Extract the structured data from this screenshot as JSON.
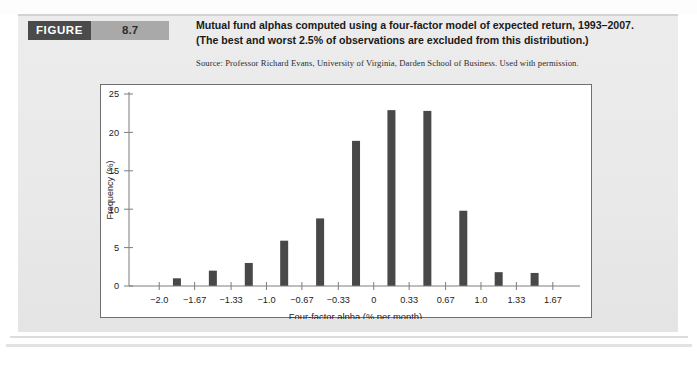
{
  "figure": {
    "tag_word": "FIGURE",
    "number": "8.7",
    "title_line1": "Mutual fund alphas computed using a four-factor model of expected return, 1993–2007.",
    "title_line2": "(The best and worst 2.5% of observations are excluded from this distribution.)",
    "source": "Source: Professor Richard Evans, University of Virginia, Darden School of Business. Used with permission."
  },
  "colors": {
    "bar": "#484848",
    "axis": "#7d7d7d",
    "tag_dark": "#4b4b4b",
    "tag_light": "#a9a9a9",
    "page_bg": "#eaeaea",
    "plot_bg": "#ffffff"
  },
  "chart_data": {
    "type": "bar",
    "title": "Mutual fund alphas computed using a four-factor model of expected return, 1993–2007.",
    "xlabel": "Four-factor alpha (% per month)",
    "ylabel": "Frequency (%)",
    "xlim": [
      -2.17,
      1.83
    ],
    "ylim": [
      0,
      25
    ],
    "grid": false,
    "legend": null,
    "x_tick_labels": [
      "−2.0",
      "−1.67",
      "−1.33",
      "−1.0",
      "−0.67",
      "−0.33",
      "0",
      "0.33",
      "0.67",
      "1.0",
      "1.33",
      "1.67"
    ],
    "x_tick_values": [
      -2.0,
      -1.67,
      -1.33,
      -1.0,
      -0.67,
      -0.33,
      0,
      0.33,
      0.67,
      1.0,
      1.33,
      1.67
    ],
    "y_tick_labels": [
      "0",
      "5",
      "10",
      "15",
      "20",
      "25"
    ],
    "y_tick_values": [
      0,
      5,
      10,
      15,
      20,
      25
    ],
    "bin_centers": [
      -1.835,
      -1.5,
      -1.165,
      -0.835,
      -0.5,
      -0.165,
      0.165,
      0.5,
      0.835,
      1.165,
      1.5
    ],
    "categories": [
      "−1.835",
      "−1.5",
      "−1.165",
      "−0.835",
      "−0.5",
      "−0.165",
      "0.165",
      "0.5",
      "0.835",
      "1.165",
      "1.5"
    ],
    "values": [
      1.0,
      2.0,
      3.0,
      5.9,
      8.8,
      18.9,
      22.9,
      22.8,
      9.8,
      1.8,
      1.7
    ]
  }
}
